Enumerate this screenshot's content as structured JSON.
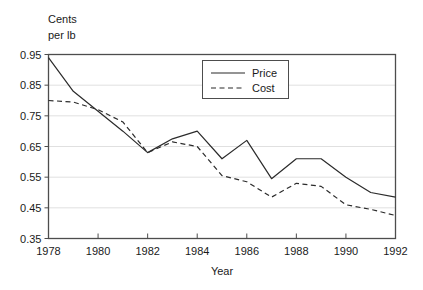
{
  "chart_data": {
    "type": "line",
    "title": "",
    "xlabel": "Year",
    "ylabel": "Cents per lb",
    "ylabel_line1": "Cents",
    "ylabel_line2": "per lb",
    "x": [
      1978,
      1979,
      1980,
      1981,
      1982,
      1983,
      1984,
      1985,
      1986,
      1987,
      1988,
      1989,
      1990,
      1991,
      1992
    ],
    "categories": [
      "1978",
      "1979",
      "1980",
      "1981",
      "1982",
      "1983",
      "1984",
      "1985",
      "1986",
      "1987",
      "1988",
      "1989",
      "1990",
      "1991",
      "1992"
    ],
    "series": [
      {
        "name": "Price",
        "style": "solid",
        "color": "#2b2b2b",
        "values": [
          0.94,
          0.83,
          0.765,
          0.7,
          0.63,
          0.675,
          0.7,
          0.61,
          0.67,
          0.545,
          0.61,
          0.61,
          0.55,
          0.5,
          0.485
        ]
      },
      {
        "name": "Cost",
        "style": "dashed",
        "color": "#2b2b2b",
        "values": [
          0.8,
          0.795,
          0.77,
          0.73,
          0.63,
          0.665,
          0.65,
          0.555,
          0.535,
          0.485,
          0.53,
          0.52,
          0.46,
          0.445,
          0.425
        ]
      }
    ],
    "xlim": [
      1978,
      1992
    ],
    "ylim": [
      0.35,
      0.95
    ],
    "xticks": [
      1978,
      1980,
      1982,
      1984,
      1986,
      1988,
      1990,
      1992
    ],
    "xtick_labels": [
      "1978",
      "1980",
      "1982",
      "1984",
      "1986",
      "1988",
      "1990",
      "1992"
    ],
    "yticks": [
      0.35,
      0.45,
      0.55,
      0.65,
      0.75,
      0.85,
      0.95
    ],
    "ytick_labels": [
      "0.35",
      "0.45",
      "0.55",
      "0.65",
      "0.75",
      "0.85",
      "0.95"
    ],
    "grid": true,
    "grid_axis": "y",
    "legend_position": "top-center",
    "legend_entries": [
      "Price",
      "Cost"
    ]
  }
}
